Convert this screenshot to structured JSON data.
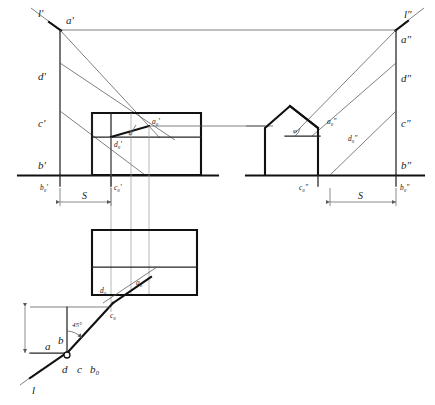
{
  "drawing": {
    "title": "Descriptive geometry construction: shadow of a line on a building (two projections and plan)",
    "line_colors": {
      "heavy_outline": "#111111",
      "medium_line": "#242424",
      "thin_line": "#555555",
      "projection_line": "#9a9a9a",
      "dimension_line": "#5a5a5a",
      "background": "#ffffff",
      "text": "#1a1a1a"
    },
    "front_view": {
      "name": "front-elevation",
      "labels": {
        "ray_line": "l'",
        "point_a": "a'",
        "point_d": "d'",
        "point_c": "c'",
        "point_b": "b'",
        "point_a0": "a₀'",
        "point_d0": "d₀'",
        "point_b0": "b₀'",
        "point_c0": "c₀'",
        "angle": "φ"
      },
      "dimension": "S"
    },
    "side_view": {
      "name": "side-elevation",
      "labels": {
        "ray_line": "l″",
        "point_a": "a″",
        "point_d": "d″",
        "point_c": "c″",
        "point_b": "b″",
        "point_a0": "a₀″",
        "point_d0": "d₀″",
        "point_c0": "c₀″",
        "point_b0": "b₀″",
        "angle": "φ"
      },
      "dimension": "S"
    },
    "plan_view": {
      "name": "plan-top-view",
      "labels": {
        "point_d0": "d₀",
        "point_a0": "a₀"
      }
    },
    "angle_detail": {
      "name": "angle-construction",
      "labels": {
        "ray_line": "l",
        "point_a": "a",
        "point_b": "b",
        "point_d": "d",
        "point_c": "c",
        "point_b0": "b₀",
        "point_c0": "c₀",
        "point_d0": "d₀",
        "point_a0": "a₀",
        "angle": "45°",
        "height": "S"
      }
    }
  }
}
